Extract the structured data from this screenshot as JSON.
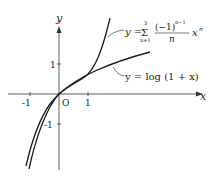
{
  "diagram": {
    "axes": {
      "x_label": "x",
      "y_label": "y",
      "origin_label": "O",
      "x_ticks": [
        "-1",
        "1"
      ],
      "y_ticks": [
        "1",
        "-1"
      ]
    },
    "curves": [
      {
        "name": "taylor-polynomial",
        "label_prefix": "y =",
        "sum_symbol": "Σ",
        "sum_upper": "3",
        "sum_lower": "n=1",
        "numerator": "(−1)",
        "numerator_exp": "n−1",
        "denominator": "n",
        "term": "x",
        "term_exp": "n"
      },
      {
        "name": "log-curve",
        "label": "y = log (1 + x)"
      }
    ],
    "colors": {
      "curve": "#1a1a1a",
      "axis": "#333333",
      "text": "#222222"
    }
  }
}
